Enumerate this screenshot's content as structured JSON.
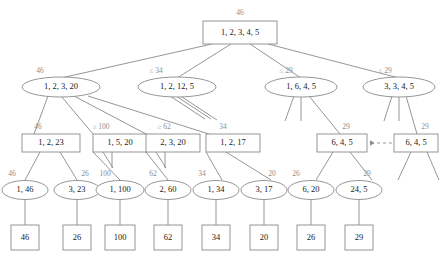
{
  "diagram": {
    "colors": {
      "stroke": "#8a8a8a",
      "text": "#1a1a1a",
      "label": "#8d8d8d",
      "background": "#ffffff"
    },
    "nodes": {
      "root": {
        "label": "1, 2, 3, 4, 5",
        "bound": "46",
        "shape": "box"
      },
      "l2a": {
        "label": "1, 2, 3, 20",
        "bound": "46",
        "shape": "ellipse"
      },
      "l2b": {
        "label": "1, 2, 12, 5",
        "bound": "≤ 34",
        "shape": "ellipse"
      },
      "l2c": {
        "label": "1, 6, 4, 5",
        "bound": "≤ 29",
        "shape": "ellipse"
      },
      "l2d": {
        "label": "3, 3, 4, 5",
        "bound": "≤ 29",
        "shape": "ellipse"
      },
      "l3a": {
        "label": "1, 2, 23",
        "bound": "46",
        "shape": "box"
      },
      "l3b": {
        "label": "1, 5, 20",
        "bound": "≥ 100",
        "shape": "box"
      },
      "l3c": {
        "label": "2, 3, 20",
        "bound": "≥ 62",
        "shape": "box"
      },
      "l3d": {
        "label": "1, 2, 17",
        "bound": "34",
        "shape": "box"
      },
      "l3e": {
        "label": "6, 4, 5",
        "bound": "29",
        "shape": "box"
      },
      "l3f": {
        "label": "6, 4, 5",
        "bound": "29",
        "shape": "box"
      },
      "l4a": {
        "label": "1, 46",
        "bound": "46",
        "shape": "ellipse"
      },
      "l4b": {
        "label": "3, 23",
        "bound": "26",
        "shape": "ellipse"
      },
      "l4c": {
        "label": "1, 100",
        "bound": "100",
        "shape": "ellipse"
      },
      "l4d": {
        "label": "2, 60",
        "bound": "62",
        "shape": "ellipse"
      },
      "l4e": {
        "label": "1, 34",
        "bound": "34",
        "shape": "ellipse"
      },
      "l4f": {
        "label": "3, 17",
        "bound": "20",
        "shape": "ellipse"
      },
      "l4g": {
        "label": "6, 20",
        "bound": "26",
        "shape": "ellipse"
      },
      "l4h": {
        "label": "24, 5",
        "bound": "29",
        "shape": "ellipse"
      },
      "leaf1": {
        "label": "46",
        "shape": "box"
      },
      "leaf2": {
        "label": "26",
        "shape": "box"
      },
      "leaf3": {
        "label": "100",
        "shape": "box"
      },
      "leaf4": {
        "label": "62",
        "shape": "box"
      },
      "leaf5": {
        "label": "34",
        "shape": "box"
      },
      "leaf6": {
        "label": "20",
        "shape": "box"
      },
      "leaf7": {
        "label": "26",
        "shape": "box"
      },
      "leaf8": {
        "label": "29",
        "shape": "box"
      }
    },
    "dashed_link": {
      "from": "l3f",
      "to": "l3e",
      "direction": "left",
      "style": "dashed-arrow"
    }
  }
}
